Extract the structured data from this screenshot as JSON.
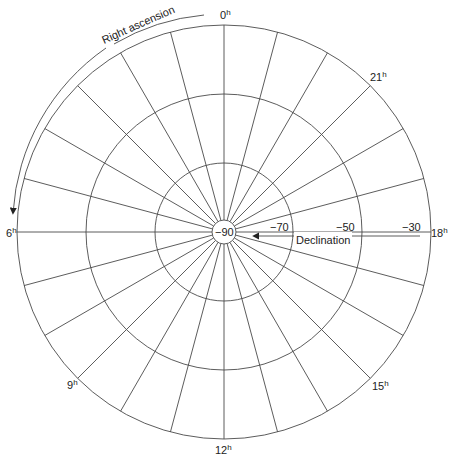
{
  "diagram": {
    "center_label": "−90",
    "colors": {
      "line": "#4a4a4a",
      "text": "#222222",
      "background": "#ffffff"
    },
    "geometry": {
      "cx": 224,
      "cy": 232,
      "r_outer": 207,
      "r_circles": [
        12,
        69,
        138,
        207
      ]
    },
    "right_ascension": {
      "label": "Right ascension",
      "hour_labels": [
        {
          "hour": 0,
          "text": "0",
          "sup": "h"
        },
        {
          "hour": 6,
          "text": "6",
          "sup": "h"
        },
        {
          "hour": 9,
          "text": "9",
          "sup": "h"
        },
        {
          "hour": 12,
          "text": "12",
          "sup": "h"
        },
        {
          "hour": 15,
          "text": "15",
          "sup": "h"
        },
        {
          "hour": 18,
          "text": "18",
          "sup": "h"
        },
        {
          "hour": 21,
          "text": "21",
          "sup": "h"
        }
      ],
      "radial_lines": 24
    },
    "declination": {
      "label": "Declination",
      "ticks": [
        "−90",
        "−70",
        "−50",
        "−30"
      ]
    }
  }
}
